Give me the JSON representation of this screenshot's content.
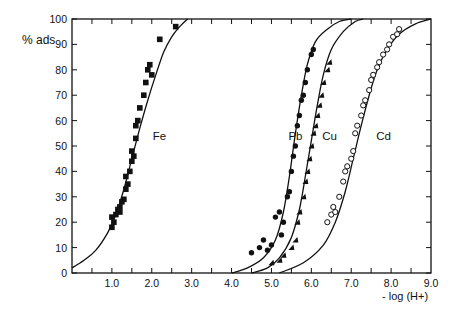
{
  "chart_data": {
    "type": "line",
    "title": "",
    "xlabel": "- log (H+)",
    "ylabel": "% ads",
    "xlim": [
      0,
      9.0
    ],
    "ylim": [
      0,
      100
    ],
    "grid": false,
    "x_ticks": [
      0.5,
      1.0,
      1.5,
      2.0,
      2.5,
      3.0,
      3.5,
      4.0,
      4.5,
      5.0,
      5.5,
      6.0,
      6.5,
      7.0,
      7.5,
      8.0,
      8.5
    ],
    "x_tick_labels": [
      {
        "x": 1.0,
        "label": "1.0"
      },
      {
        "x": 2.0,
        "label": "2.0"
      },
      {
        "x": 3.0,
        "label": "3.0"
      },
      {
        "x": 4.0,
        "label": "4.0"
      },
      {
        "x": 5.0,
        "label": "5.0"
      },
      {
        "x": 6.0,
        "label": "6.0"
      },
      {
        "x": 7.0,
        "label": "7.0"
      },
      {
        "x": 8.0,
        "label": "8.0"
      },
      {
        "x": 9.0,
        "label": "9.0"
      }
    ],
    "y_ticks": [
      0,
      10,
      20,
      30,
      40,
      50,
      60,
      70,
      80,
      90,
      100
    ],
    "series": [
      {
        "name": "Fe",
        "marker": "filled-square",
        "label_pos": [
          1.9,
          54
        ],
        "curve": [
          [
            0,
            2
          ],
          [
            0.3,
            5
          ],
          [
            0.6,
            9
          ],
          [
            0.9,
            16
          ],
          [
            1.1,
            23
          ],
          [
            1.3,
            33
          ],
          [
            1.5,
            45
          ],
          [
            1.7,
            57
          ],
          [
            1.9,
            68
          ],
          [
            2.1,
            78
          ],
          [
            2.3,
            87
          ],
          [
            2.5,
            93
          ],
          [
            2.7,
            97
          ],
          [
            2.9,
            100
          ]
        ],
        "points": [
          [
            1.0,
            18
          ],
          [
            1.0,
            22
          ],
          [
            1.05,
            20
          ],
          [
            1.1,
            23
          ],
          [
            1.15,
            25
          ],
          [
            1.2,
            26
          ],
          [
            1.25,
            28
          ],
          [
            1.2,
            24
          ],
          [
            1.3,
            29
          ],
          [
            1.35,
            33
          ],
          [
            1.4,
            35
          ],
          [
            1.35,
            38
          ],
          [
            1.45,
            40
          ],
          [
            1.5,
            44
          ],
          [
            1.55,
            46
          ],
          [
            1.5,
            48
          ],
          [
            1.6,
            53
          ],
          [
            1.6,
            58
          ],
          [
            1.65,
            60
          ],
          [
            1.7,
            65
          ],
          [
            1.8,
            70
          ],
          [
            1.85,
            75
          ],
          [
            1.9,
            80
          ],
          [
            1.95,
            82
          ],
          [
            2.0,
            78
          ],
          [
            2.2,
            92
          ],
          [
            2.6,
            97
          ]
        ]
      },
      {
        "name": "Pb",
        "marker": "filled-circle",
        "label_pos": [
          5.3,
          54
        ],
        "curve": [
          [
            4.0,
            0
          ],
          [
            4.4,
            2
          ],
          [
            4.8,
            6
          ],
          [
            5.1,
            13
          ],
          [
            5.3,
            24
          ],
          [
            5.45,
            38
          ],
          [
            5.6,
            55
          ],
          [
            5.75,
            70
          ],
          [
            5.9,
            82
          ],
          [
            6.1,
            91
          ],
          [
            6.4,
            96
          ],
          [
            6.7,
            99
          ],
          [
            7.0,
            100
          ]
        ],
        "points": [
          [
            4.5,
            8
          ],
          [
            4.8,
            13
          ],
          [
            4.7,
            10
          ],
          [
            5.0,
            11
          ],
          [
            4.9,
            9
          ],
          [
            5.1,
            22
          ],
          [
            5.2,
            24
          ],
          [
            5.25,
            15
          ],
          [
            5.3,
            20
          ],
          [
            5.4,
            30
          ],
          [
            5.45,
            32
          ],
          [
            5.5,
            40
          ],
          [
            5.55,
            46
          ],
          [
            5.6,
            50
          ],
          [
            5.65,
            58
          ],
          [
            5.7,
            62
          ],
          [
            5.75,
            68
          ],
          [
            5.8,
            70
          ],
          [
            5.85,
            75
          ],
          [
            5.9,
            80
          ],
          [
            6.0,
            86
          ],
          [
            6.05,
            88
          ]
        ]
      },
      {
        "name": "Cu",
        "marker": "filled-triangle",
        "label_pos": [
          6.15,
          54
        ],
        "curve": [
          [
            4.5,
            0
          ],
          [
            4.9,
            2
          ],
          [
            5.2,
            6
          ],
          [
            5.5,
            14
          ],
          [
            5.7,
            25
          ],
          [
            5.85,
            38
          ],
          [
            6.0,
            52
          ],
          [
            6.15,
            66
          ],
          [
            6.3,
            78
          ],
          [
            6.5,
            88
          ],
          [
            6.8,
            95
          ],
          [
            7.1,
            99
          ],
          [
            7.3,
            100
          ]
        ],
        "points": [
          [
            5.0,
            4
          ],
          [
            5.2,
            5
          ],
          [
            5.3,
            7
          ],
          [
            5.5,
            10
          ],
          [
            5.6,
            13
          ],
          [
            5.65,
            20
          ],
          [
            5.7,
            24
          ],
          [
            5.8,
            30
          ],
          [
            5.85,
            36
          ],
          [
            5.9,
            40
          ],
          [
            5.95,
            45
          ],
          [
            6.0,
            50
          ],
          [
            6.05,
            55
          ],
          [
            6.1,
            58
          ],
          [
            6.15,
            62
          ],
          [
            6.2,
            66
          ],
          [
            6.25,
            70
          ],
          [
            6.3,
            75
          ],
          [
            6.4,
            80
          ],
          [
            6.45,
            83
          ]
        ]
      },
      {
        "name": "Cd",
        "marker": "open-circle",
        "label_pos": [
          7.5,
          54
        ],
        "curve": [
          [
            5.2,
            0
          ],
          [
            5.8,
            4
          ],
          [
            6.3,
            11
          ],
          [
            6.6,
            20
          ],
          [
            6.85,
            32
          ],
          [
            7.05,
            45
          ],
          [
            7.25,
            58
          ],
          [
            7.45,
            70
          ],
          [
            7.65,
            80
          ],
          [
            7.9,
            88
          ],
          [
            8.2,
            94
          ],
          [
            8.6,
            98
          ],
          [
            9.0,
            100
          ]
        ],
        "points": [
          [
            6.4,
            20
          ],
          [
            6.5,
            23
          ],
          [
            6.55,
            26
          ],
          [
            6.6,
            24
          ],
          [
            6.7,
            30
          ],
          [
            6.8,
            36
          ],
          [
            6.85,
            40
          ],
          [
            6.9,
            42
          ],
          [
            7.0,
            45
          ],
          [
            7.05,
            48
          ],
          [
            7.1,
            55
          ],
          [
            7.15,
            58
          ],
          [
            7.25,
            62
          ],
          [
            7.3,
            66
          ],
          [
            7.35,
            68
          ],
          [
            7.45,
            72
          ],
          [
            7.5,
            76
          ],
          [
            7.55,
            78
          ],
          [
            7.65,
            81
          ],
          [
            7.7,
            83
          ],
          [
            7.8,
            86
          ],
          [
            7.9,
            88
          ],
          [
            7.95,
            90
          ],
          [
            8.05,
            93
          ],
          [
            8.15,
            94
          ],
          [
            8.2,
            96
          ]
        ]
      }
    ]
  }
}
